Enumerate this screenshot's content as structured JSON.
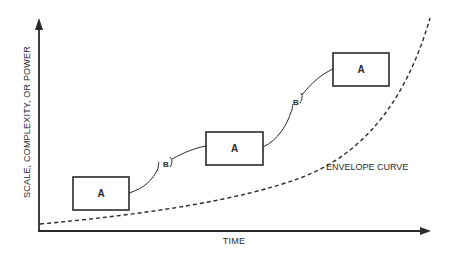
{
  "diagram": {
    "x_axis_label": "TIME",
    "y_axis_label": "SCALE, COMPLEXITY, OR POWER",
    "envelope_label": "ENVELOPE CURVE",
    "boxes": [
      {
        "label": "A",
        "x": 73,
        "y": 177,
        "w": 56,
        "h": 33
      },
      {
        "label": "A",
        "x": 206,
        "y": 132,
        "w": 57,
        "h": 33
      },
      {
        "label": "A",
        "x": 333,
        "y": 53,
        "w": 56,
        "h": 33
      }
    ],
    "transitions": [
      {
        "label": "B"
      },
      {
        "label": "B"
      }
    ],
    "colors": {
      "ink": "#2a2a2a",
      "background": "#ffffff"
    }
  }
}
